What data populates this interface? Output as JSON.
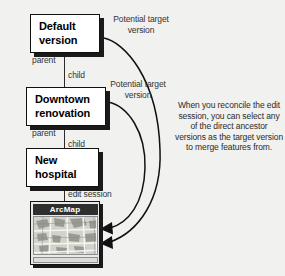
{
  "diagram": {
    "background_color": "#f1f1ef",
    "boxes": [
      {
        "id": "default",
        "line1": "Default",
        "line2": "version"
      },
      {
        "id": "downtown",
        "line1": "Downtown",
        "line2": "renovation"
      },
      {
        "id": "hospital",
        "line1": "New",
        "line2": "hospital"
      }
    ],
    "edge_labels": {
      "parent_1": "parent",
      "child_1": "child",
      "parent_2": "parent",
      "child_2": "child",
      "edit_session": "edit session"
    },
    "arrow_labels": [
      "Potential target version",
      "Potential target version"
    ],
    "note": "When you reconcile the edit session, you can select any of the direct ancestor versions as the target version to merge features from.",
    "arcmap": {
      "title": "ArcMap"
    }
  }
}
